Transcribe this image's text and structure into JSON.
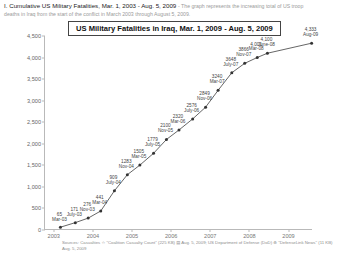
{
  "header": {
    "title": "I. Cumulative US Military Fatalities, Mar. 1, 2003 - Aug. 5, 2009",
    "description_line1": "- The graph represents the increasing total of US troop",
    "description_line2": "deaths in Iraq from the start of the conflict in March 2003 through August 5, 2009."
  },
  "footnote": {
    "line1": "Sources: Casualties ☆ \"Coalition Casualty Count\" (225 KB) ▤ Aug. 5, 2009; US Department of Defense (DoD) ⊕ \"DefenseLink News\" (11 KB)",
    "line2": "Aug. 5, 2009"
  },
  "chart_data": {
    "type": "line",
    "title": "US Military Fatalities in Iraq, Mar. 1, 2009 - Aug. 5, 2009",
    "xlabel": "",
    "ylabel": "",
    "ylim": [
      0,
      4500
    ],
    "grid": false,
    "legend": "none",
    "yticks": [
      "0",
      "500",
      "1,000",
      "1,500",
      "2,000",
      "2,500",
      "3,000",
      "3,500",
      "4,000",
      "4,500"
    ],
    "ytick_values": [
      0,
      500,
      1000,
      1500,
      2000,
      2500,
      3000,
      3500,
      4000,
      4500
    ],
    "xticks": [
      "2003",
      "2004",
      "2005",
      "2006",
      "2007",
      "2008",
      "2009"
    ],
    "xtick_values": [
      2003,
      2004,
      2005,
      2006,
      2007,
      2008,
      2009
    ],
    "xlim": [
      2002.75,
      2009.6
    ],
    "series_name": "Cumulative US military fatalities",
    "line_color": "#555555",
    "marker_color": "#333333",
    "points": [
      {
        "x": 2003.17,
        "y": 65,
        "value": "65",
        "date": "Mar-03",
        "lx": -1,
        "ly": -4
      },
      {
        "x": 2003.55,
        "y": 171,
        "value": "171",
        "date": "July-03",
        "lx": -1,
        "ly": -5
      },
      {
        "x": 2003.88,
        "y": 276,
        "value": "276",
        "date": "Nov-03",
        "lx": -1,
        "ly": -5
      },
      {
        "x": 2004.2,
        "y": 441,
        "value": "441",
        "date": "Mar-04",
        "lx": -1,
        "ly": -5
      },
      {
        "x": 2004.55,
        "y": 909,
        "value": "909",
        "date": "July-04",
        "lx": -1,
        "ly": -5
      },
      {
        "x": 2004.88,
        "y": 1283,
        "value": "1283",
        "date": "Nov-04",
        "lx": -1,
        "ly": -5
      },
      {
        "x": 2005.2,
        "y": 1505,
        "value": "1505",
        "date": "Mar-05",
        "lx": -1,
        "ly": -5
      },
      {
        "x": 2005.55,
        "y": 1779,
        "value": "1779",
        "date": "July-05",
        "lx": -1,
        "ly": -5
      },
      {
        "x": 2005.88,
        "y": 2100,
        "value": "2100",
        "date": "Nov-05",
        "lx": -1,
        "ly": -5
      },
      {
        "x": 2006.2,
        "y": 2320,
        "value": "2320",
        "date": "Mar-06",
        "lx": -1,
        "ly": -5
      },
      {
        "x": 2006.55,
        "y": 2576,
        "value": "2576",
        "date": "July-06",
        "lx": -1,
        "ly": -5
      },
      {
        "x": 2006.88,
        "y": 2849,
        "value": "2849",
        "date": "Nov-06",
        "lx": -1,
        "ly": -5
      },
      {
        "x": 2007.2,
        "y": 3240,
        "value": "3240",
        "date": "Mar-07",
        "lx": -1,
        "ly": -5
      },
      {
        "x": 2007.55,
        "y": 3648,
        "value": "3648",
        "date": "July-07",
        "lx": -1,
        "ly": -5
      },
      {
        "x": 2007.88,
        "y": 3866,
        "value": "3866",
        "date": "Nov-07",
        "lx": -1,
        "ly": -5
      },
      {
        "x": 2008.2,
        "y": 4001,
        "value": "4,001",
        "date": "Mar-08",
        "lx": -1,
        "ly": -5
      },
      {
        "x": 2008.46,
        "y": 4100,
        "value": "4,100",
        "date": "June-08",
        "lx": -1,
        "ly": -5
      },
      {
        "x": 2009.59,
        "y": 4333,
        "value": "4,333",
        "date": "Aug-09",
        "lx": -1,
        "ly": -5
      }
    ]
  }
}
